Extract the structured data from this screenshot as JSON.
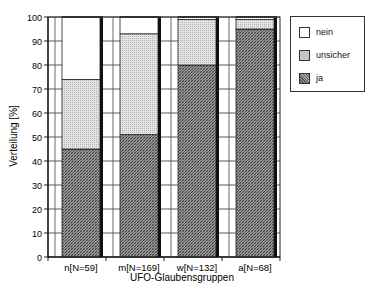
{
  "chart_data": {
    "type": "bar",
    "stacked": true,
    "title": "",
    "xlabel": "UFO-Glaubensgruppen",
    "ylabel": "Verteilung [%]",
    "ylim": [
      0,
      100
    ],
    "yticks": [
      0,
      10,
      20,
      30,
      40,
      50,
      60,
      70,
      80,
      90,
      100
    ],
    "grid": true,
    "legend_position": "right",
    "categories": [
      "n[N=59]",
      "m[N=169]",
      "w[N=132]",
      "a[N=68]"
    ],
    "series": [
      {
        "name": "ja",
        "values": [
          45,
          51,
          80,
          95
        ],
        "color": "#777777"
      },
      {
        "name": "unsicher",
        "values": [
          29,
          42,
          19,
          4
        ],
        "color": "#d9d9d9"
      },
      {
        "name": "nein",
        "values": [
          26,
          7,
          1,
          1
        ],
        "color": "#ffffff"
      }
    ]
  },
  "legend": {
    "items": [
      {
        "label": "nein",
        "key": "nein"
      },
      {
        "label": "unsicher",
        "key": "unsicher"
      },
      {
        "label": "ja",
        "key": "ja"
      }
    ]
  }
}
